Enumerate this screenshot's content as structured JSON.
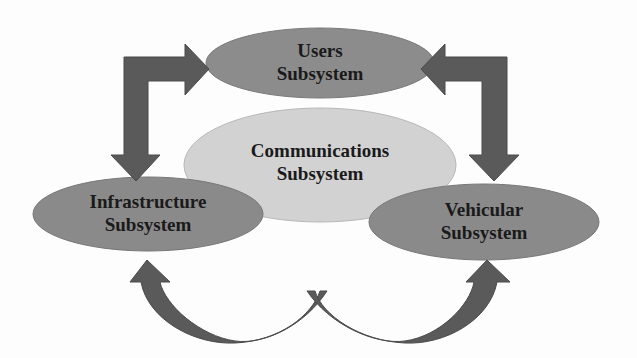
{
  "diagram": {
    "nodes": [
      {
        "id": "users",
        "line1": "Users",
        "line2": "Subsystem",
        "fill": "#8c8c8c"
      },
      {
        "id": "communications",
        "line1": "Communications",
        "line2": "Subsystem",
        "fill": "#d2d2d2"
      },
      {
        "id": "infrastructure",
        "line1": "Infrastructure",
        "line2": "Subsystem",
        "fill": "#8a8a8a"
      },
      {
        "id": "vehicular",
        "line1": "Vehicular",
        "line2": "Subsystem",
        "fill": "#8a8a8a"
      }
    ],
    "edges": [
      {
        "from": "infrastructure",
        "to": "users",
        "type": "bidirectional-elbow-arrow"
      },
      {
        "from": "vehicular",
        "to": "users",
        "type": "bidirectional-elbow-arrow"
      },
      {
        "from": "infrastructure",
        "to": "vehicular",
        "type": "bidirectional-curved-arrow"
      }
    ],
    "colors": {
      "arrow": "#5a5a5a",
      "background": "#fdfdfd",
      "text": "#1a1a1a"
    }
  }
}
